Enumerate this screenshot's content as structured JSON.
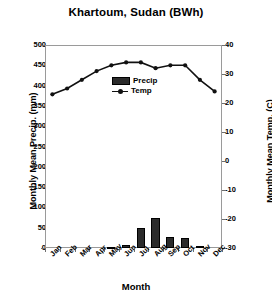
{
  "chart_data": {
    "type": "bar",
    "title": "Khartoum, Sudan (BWh)",
    "xlabel": "Month",
    "ylabel": "Monthly Mean Precip. (mm)",
    "ylabel_secondary": "Monthly Mean Temp. (C)",
    "categories": [
      "Jan",
      "Feb",
      "Mar",
      "Apr",
      "May",
      "Jun",
      "Jul",
      "Aug",
      "Sep",
      "Oct",
      "Nov",
      "Dec"
    ],
    "ylim": [
      0,
      500
    ],
    "ylim_secondary": [
      -30,
      40
    ],
    "yticks": [
      0,
      50,
      100,
      150,
      200,
      250,
      300,
      350,
      400,
      450,
      500
    ],
    "yticks_secondary": [
      -30,
      -20,
      -10,
      0,
      10,
      20,
      30,
      40
    ],
    "grid": false,
    "legend_position": "center",
    "series": [
      {
        "name": "Precip",
        "type": "bar",
        "axis": "left",
        "unit": "mm",
        "color": "#2b2b2b",
        "values": [
          0,
          0,
          0,
          0,
          2,
          7,
          50,
          75,
          26,
          24,
          4,
          0
        ]
      },
      {
        "name": "Temp",
        "type": "line",
        "axis": "right",
        "unit": "C",
        "color": "#111111",
        "values": [
          23,
          25,
          28,
          31,
          33,
          34,
          34,
          32,
          33,
          33,
          28,
          24
        ]
      }
    ]
  },
  "legend": {
    "precip_label": "Precip",
    "temp_label": "Temp"
  }
}
